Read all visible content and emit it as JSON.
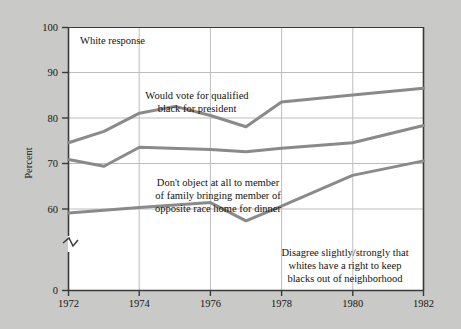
{
  "figure": {
    "background_color": "#c9c9c7",
    "plot_background_color": "#ffffff",
    "line_color": "#8a8a8a",
    "axis_color": "#3a3a3a",
    "grid_color": "#b9b9b9",
    "inner_title": "White response",
    "axis_break_note": "y-axis break between 60 and 0"
  },
  "chart_data": {
    "type": "line",
    "title": "White response",
    "xlabel": "",
    "ylabel": "Percent",
    "xlim": [
      1972,
      1982
    ],
    "ylim": [
      55,
      100
    ],
    "ytick_labels": [
      "0",
      "60",
      "70",
      "80",
      "90",
      "100"
    ],
    "ytick_values": [
      0,
      60,
      70,
      80,
      90,
      100
    ],
    "xtick_labels": [
      "1972",
      "1974",
      "1976",
      "1978",
      "1980",
      "1982"
    ],
    "xtick_values": [
      1972,
      1974,
      1976,
      1978,
      1980,
      1982
    ],
    "grid": true,
    "legend": "annotations-inline",
    "series": [
      {
        "name": "Would vote for qualified black for president",
        "x": [
          1972,
          1973,
          1974,
          1975,
          1976,
          1977,
          1978,
          1980,
          1982
        ],
        "values": [
          74.5,
          77,
          81,
          82.5,
          80.5,
          78,
          83.5,
          85,
          86.5
        ]
      },
      {
        "name": "Don't object at all to member of family bringing member of opposite race home for dinner",
        "x": [
          1972,
          1973,
          1974,
          1976,
          1977,
          1978,
          1980,
          1982
        ],
        "values": [
          70.8,
          69.3,
          73.5,
          73,
          72.5,
          73.3,
          74.5,
          78.3
        ]
      },
      {
        "name": "Disagree slightly/strongly that whites have a right to keep blacks out of neighborhood",
        "x": [
          1972,
          1974,
          1976,
          1977,
          1978,
          1980,
          1982
        ],
        "values": [
          59,
          60.2,
          61.3,
          57.3,
          60.5,
          67.3,
          70.5
        ]
      }
    ],
    "annotations": [
      {
        "id": "annotation-vote",
        "lines": [
          "Would vote for qualified",
          "black for president"
        ],
        "align": "center"
      },
      {
        "id": "annotation-dinner",
        "lines": [
          "Don't object at all to member",
          "of family bringing member of",
          "opposite race home for dinner"
        ],
        "align": "center"
      },
      {
        "id": "annotation-neighborhood",
        "lines": [
          "Disagree slightly/strongly that",
          "whites have a right to keep",
          "blacks out of neighborhood"
        ],
        "align": "center"
      }
    ]
  }
}
